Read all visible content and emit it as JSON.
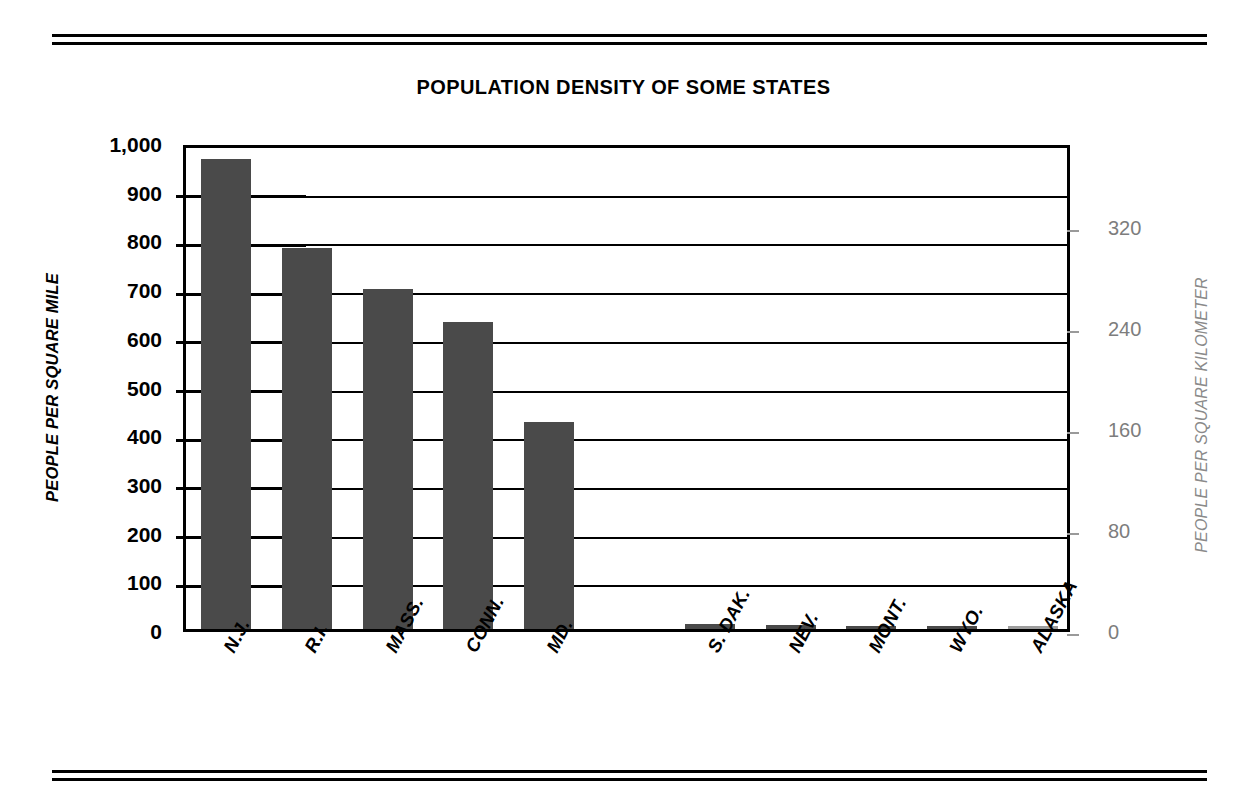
{
  "chart_data": {
    "type": "bar",
    "title": "POPULATION DENSITY OF SOME STATES",
    "xlabel": "",
    "ylabel": "PEOPLE PER SQUARE MILE",
    "y2label": "PEOPLE PER SQUARE KILOMETER",
    "categories": [
      "N.J.",
      "R.I.",
      "MASS.",
      "CONN.",
      "MD.",
      "S. DAK.",
      "NEV.",
      "MONT.",
      "WYO.",
      "ALASKA"
    ],
    "values": [
      965,
      782,
      698,
      630,
      426,
      10,
      9,
      6,
      5,
      1
    ],
    "units": "people per square mile",
    "ylim": [
      0,
      1000
    ],
    "yticks": [
      0,
      100,
      200,
      300,
      400,
      500,
      600,
      700,
      800,
      900,
      1000
    ],
    "ytick_labels": [
      "0",
      "100",
      "200",
      "300",
      "400",
      "500",
      "600",
      "700",
      "800",
      "900",
      "1,000"
    ],
    "y2lim": [
      0,
      386
    ],
    "y2ticks": [
      0,
      80,
      160,
      240,
      320
    ],
    "y2tick_labels": [
      "0",
      "80",
      "160",
      "240",
      "320"
    ],
    "grid": true,
    "legend": false,
    "bar_color": "#4a4a4a",
    "gap_after_index": 4
  },
  "figure": {
    "top_rule": "double-rule",
    "bottom_rule": "double-rule",
    "background": "#ffffff",
    "axis_color": "#000000",
    "right_axis_color": "#7d7d7d"
  }
}
